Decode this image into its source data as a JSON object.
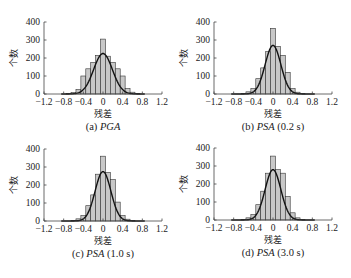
{
  "chart_data": [
    {
      "type": "bar",
      "caption_prefix": "(a)",
      "caption_italic": "PGA",
      "caption_suffix": "",
      "xlabel": "残差",
      "ylabel": "个数",
      "xlim": [
        -1.2,
        1.2
      ],
      "ylim": [
        0,
        400
      ],
      "xticks": [
        "-1.2",
        "-0.8",
        "-0.4",
        "0",
        "0.4",
        "0.8",
        "1.2"
      ],
      "yticks": [
        "0",
        "100",
        "200",
        "300",
        "400"
      ],
      "bin_width": 0.1,
      "bin_centers": [
        -0.7,
        -0.6,
        -0.5,
        -0.4,
        -0.3,
        -0.2,
        -0.1,
        0,
        0.1,
        0.2,
        0.3,
        0.4,
        0.5,
        0.6,
        0.7
      ],
      "values": [
        2,
        8,
        25,
        100,
        140,
        175,
        215,
        305,
        210,
        175,
        140,
        100,
        30,
        10,
        3
      ],
      "curve": {
        "type": "normal",
        "mean": 0,
        "sd": 0.19,
        "peak": 225
      },
      "bar_color": "#c8c8c8",
      "grid": false
    },
    {
      "type": "bar",
      "caption_prefix": "(b)",
      "caption_italic": "PSA",
      "caption_suffix": "(0.2 s)",
      "xlabel": "残差",
      "ylabel": "个数",
      "xlim": [
        -1.2,
        1.2
      ],
      "ylim": [
        0,
        400
      ],
      "xticks": [
        "-1.2",
        "-0.8",
        "-0.4",
        "0",
        "0.4",
        "0.8",
        "1.2"
      ],
      "yticks": [
        "0",
        "100",
        "200",
        "300",
        "400"
      ],
      "bin_width": 0.1,
      "bin_centers": [
        -0.6,
        -0.5,
        -0.4,
        -0.3,
        -0.2,
        -0.1,
        0,
        0.1,
        0.2,
        0.3,
        0.4,
        0.5,
        0.6
      ],
      "values": [
        3,
        12,
        30,
        85,
        145,
        235,
        365,
        265,
        215,
        120,
        30,
        10,
        2
      ],
      "curve": {
        "type": "normal",
        "mean": 0,
        "sd": 0.16,
        "peak": 270
      },
      "bar_color": "#c8c8c8",
      "grid": false
    },
    {
      "type": "bar",
      "caption_prefix": "(c)",
      "caption_italic": "PSA",
      "caption_suffix": "(1.0 s)",
      "xlabel": "残差",
      "ylabel": "个数",
      "xlim": [
        -1.2,
        1.2
      ],
      "ylim": [
        0,
        400
      ],
      "xticks": [
        "-1.2",
        "-0.8",
        "-0.4",
        "0",
        "0.4",
        "0.8",
        "1.2"
      ],
      "yticks": [
        "0",
        "100",
        "200",
        "300",
        "400"
      ],
      "bin_width": 0.1,
      "bin_centers": [
        -0.6,
        -0.5,
        -0.4,
        -0.3,
        -0.2,
        -0.1,
        0,
        0.1,
        0.2,
        0.3,
        0.4,
        0.5,
        0.6
      ],
      "values": [
        3,
        12,
        30,
        85,
        145,
        260,
        360,
        270,
        230,
        105,
        30,
        10,
        2
      ],
      "curve": {
        "type": "normal",
        "mean": 0,
        "sd": 0.16,
        "peak": 275
      },
      "bar_color": "#c8c8c8",
      "grid": false
    },
    {
      "type": "bar",
      "caption_prefix": "(d)",
      "caption_italic": "PSA",
      "caption_suffix": "(3.0 s)",
      "xlabel": "残差",
      "ylabel": "个数",
      "xlim": [
        -1.2,
        1.2
      ],
      "ylim": [
        0,
        400
      ],
      "xticks": [
        "-1.2",
        "-0.8",
        "-0.4",
        "0",
        "0.4",
        "0.8",
        "1.2"
      ],
      "yticks": [
        "0",
        "100",
        "200",
        "300",
        "400"
      ],
      "bin_width": 0.1,
      "bin_centers": [
        -0.6,
        -0.5,
        -0.4,
        -0.3,
        -0.2,
        -0.1,
        0,
        0.1,
        0.2,
        0.3,
        0.4,
        0.5,
        0.6
      ],
      "values": [
        3,
        12,
        30,
        85,
        160,
        260,
        355,
        280,
        260,
        130,
        40,
        12,
        2
      ],
      "curve": {
        "type": "normal",
        "mean": 0,
        "sd": 0.16,
        "peak": 280
      },
      "bar_color": "#c8c8c8",
      "grid": false
    }
  ]
}
